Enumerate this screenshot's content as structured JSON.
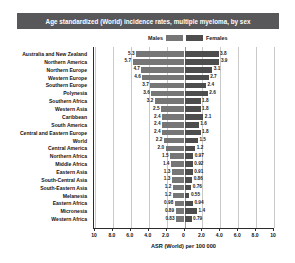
{
  "title": "Age standardized (World) incidence rates, multiple myeloma, by sex",
  "legend": {
    "male_label": "Males",
    "female_label": "Females",
    "male_color": "#767676",
    "female_color": "#4d4d4d"
  },
  "axis": {
    "title": "ASR (World) per 100 000",
    "ticks": [
      "10",
      "8.0",
      "6.0",
      "4.0",
      "2.0",
      "0",
      "2.0",
      "4.0",
      "6.0",
      "8.0",
      "10"
    ],
    "max": 10
  },
  "chart_data": {
    "type": "bar",
    "orientation": "horizontal",
    "layout": "diverging-population-pyramid",
    "title": "Age standardized (World) incidence rates, multiple myeloma, by sex",
    "xlabel": "ASR (World) per 100 000",
    "ylabel": "",
    "xlim": [
      -10,
      10
    ],
    "grid": true,
    "legend_position": "top-center",
    "categories": [
      "Australia and New Zealand",
      "Northern America",
      "Northern Europe",
      "Western Europe",
      "Southern Europe",
      "Polynesia",
      "Southern Africa",
      "Western Asia",
      "Caribbean",
      "South America",
      "Central and Eastern Europe",
      "World",
      "Central America",
      "Northern Africa",
      "Middle Africa",
      "Eastern Asia",
      "South-Central Asia",
      "South-Eastern Asia",
      "Melanesia",
      "Eastern Africa",
      "Micronesia",
      "Western Africa"
    ],
    "series": [
      {
        "name": "Males",
        "side": "left",
        "values": [
          5.3,
          5.7,
          4.7,
          4.6,
          3.7,
          3.6,
          3.2,
          2.5,
          2.4,
          2.4,
          2.4,
          2.2,
          2.0,
          1.5,
          1.4,
          1.3,
          1.3,
          1.2,
          1.2,
          0.98,
          0.89,
          0.83
        ],
        "labels": [
          "5.3",
          "5.7",
          "4.7",
          "4.6",
          "3.7",
          "3.6",
          "3.2",
          "2.5",
          "2.4",
          "2.4",
          "2.4",
          "2.2",
          "2.0",
          "1.5",
          "1.4",
          "1.3",
          "1.3",
          "1.2",
          "1.2",
          "0.98",
          "0.89",
          "0.83"
        ]
      },
      {
        "name": "Females",
        "side": "right",
        "values": [
          3.8,
          3.9,
          3.1,
          2.7,
          2.4,
          2.6,
          1.8,
          1.8,
          2.1,
          1.6,
          1.8,
          1.5,
          1.2,
          0.97,
          0.92,
          0.91,
          0.86,
          0.76,
          0.55,
          0.94,
          1.4,
          0.79
        ],
        "labels": [
          "3.8",
          "3.9",
          "3.1",
          "2.7",
          "2.4",
          "2.6",
          "1.8",
          "1.8",
          "2.1",
          "1.6",
          "1.8",
          "1.5",
          "1.2",
          "0.97",
          "0.92",
          "0.91",
          "0.86",
          "0.76",
          "0.55",
          "0.94",
          "1.4",
          "0.79"
        ]
      }
    ]
  }
}
